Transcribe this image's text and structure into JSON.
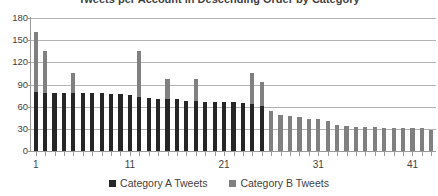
{
  "chart_data": {
    "type": "bar",
    "subtype": "stacked-column",
    "title": "Tweets per Account in Descending Order by Category",
    "xlabel": "",
    "ylabel": "",
    "ylim": [
      0,
      180
    ],
    "ytick_values": [
      180,
      150,
      120,
      90,
      60,
      30,
      0
    ],
    "ytick_labels": [
      "180",
      "150",
      "120",
      "90",
      "60",
      "30",
      "0"
    ],
    "grid": true,
    "grid_axis": "y",
    "legend_position": "bottom",
    "x": [
      1,
      2,
      3,
      4,
      5,
      6,
      7,
      8,
      9,
      10,
      11,
      12,
      13,
      14,
      15,
      16,
      17,
      18,
      19,
      20,
      21,
      22,
      23,
      24,
      25,
      26,
      27,
      28,
      29,
      30,
      31,
      32,
      33,
      34,
      35,
      36,
      37,
      38,
      39,
      40,
      41,
      42,
      43
    ],
    "xtick_values": [
      1,
      11,
      21,
      31,
      41
    ],
    "xtick_labels": [
      "1",
      "11",
      "21",
      "31",
      "41"
    ],
    "series": [
      {
        "name": "Category A Tweets",
        "color": "#262626",
        "values": [
          80,
          79,
          78,
          78,
          78,
          78,
          78,
          78,
          77,
          77,
          76,
          73,
          72,
          71,
          71,
          70,
          68,
          68,
          67,
          67,
          66,
          66,
          65,
          63,
          61,
          0,
          0,
          0,
          0,
          0,
          0,
          0,
          0,
          0,
          0,
          0,
          0,
          0,
          0,
          0,
          0,
          0,
          0
        ]
      },
      {
        "name": "Category B Tweets",
        "color": "#808080",
        "values": [
          81,
          56,
          0,
          0,
          28,
          0,
          0,
          0,
          0,
          0,
          0,
          62,
          0,
          0,
          27,
          0,
          0,
          30,
          0,
          0,
          0,
          0,
          0,
          42,
          33,
          54,
          49,
          47,
          46,
          43,
          43,
          41,
          35,
          34,
          33,
          33,
          33,
          31,
          31,
          31,
          31,
          31,
          29
        ]
      }
    ],
    "totals": [
      161,
      135,
      78,
      78,
      106,
      78,
      78,
      78,
      77,
      77,
      76,
      135,
      72,
      71,
      98,
      70,
      68,
      98,
      67,
      67,
      66,
      66,
      65,
      105,
      94,
      54,
      49,
      47,
      46,
      43,
      43,
      41,
      35,
      34,
      33,
      33,
      33,
      31,
      31,
      31,
      31,
      31,
      29
    ]
  },
  "legend": {
    "entries": [
      {
        "label": "Category A Tweets",
        "color": "#262626"
      },
      {
        "label": "Category B Tweets",
        "color": "#808080"
      }
    ]
  },
  "colors": {
    "series_a": "#262626",
    "series_b": "#808080",
    "gridline": "#b3b3b3",
    "axis": "#9a9a9a",
    "text": "#3f3f3f",
    "background": "#ffffff"
  }
}
